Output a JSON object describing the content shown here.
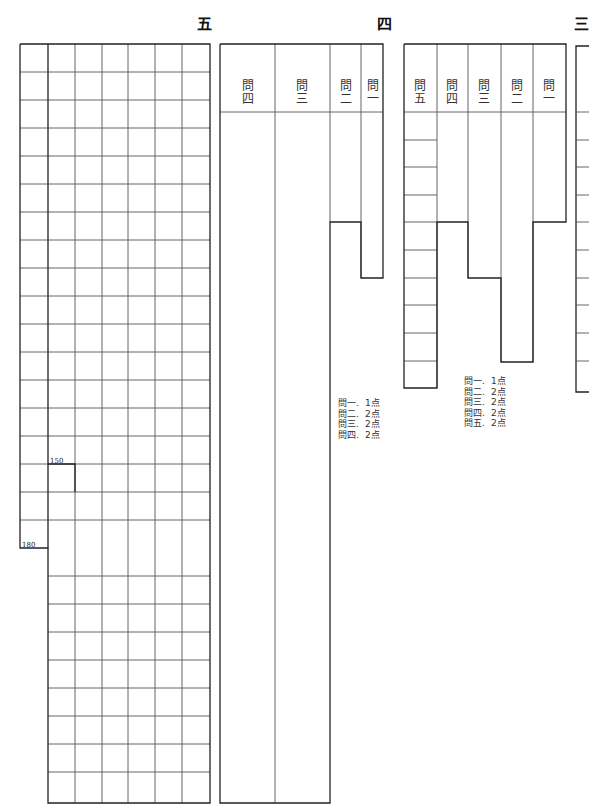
{
  "sections": {
    "five": {
      "title": "五",
      "grid": {
        "columns": 7,
        "rows": 27
      },
      "char_count_marks": [
        "150",
        "180"
      ]
    },
    "four": {
      "title": "四",
      "questions": [
        {
          "label_top": "問",
          "label_bottom": "四"
        },
        {
          "label_top": "問",
          "label_bottom": "三"
        },
        {
          "label_top": "問",
          "label_bottom": "二"
        },
        {
          "label_top": "問",
          "label_bottom": "一"
        }
      ],
      "points": [
        {
          "q": "問一.",
          "pts": "1点"
        },
        {
          "q": "問二.",
          "pts": "2点"
        },
        {
          "q": "問三.",
          "pts": "2点"
        },
        {
          "q": "問四.",
          "pts": "2点"
        }
      ]
    },
    "three": {
      "title": "三",
      "questions": [
        {
          "label_top": "問",
          "label_bottom": "五"
        },
        {
          "label_top": "問",
          "label_bottom": "四"
        },
        {
          "label_top": "問",
          "label_bottom": "三"
        },
        {
          "label_top": "問",
          "label_bottom": "二"
        },
        {
          "label_top": "問",
          "label_bottom": "一"
        }
      ],
      "points": [
        {
          "q": "問一.",
          "pts": "1点"
        },
        {
          "q": "問二.",
          "pts": "2点"
        },
        {
          "q": "問三.",
          "pts": "2点"
        },
        {
          "q": "問四.",
          "pts": "2点"
        },
        {
          "q": "問五.",
          "pts": "2点"
        }
      ]
    }
  }
}
